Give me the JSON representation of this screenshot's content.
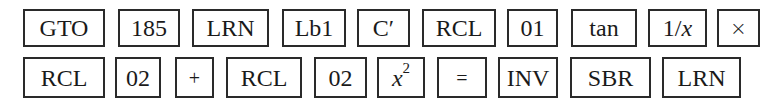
{
  "rows": [
    {
      "keys": [
        {
          "label": "GTO"
        },
        {
          "label": "185"
        },
        {
          "label": "LRN"
        },
        {
          "label": "Lb1"
        },
        {
          "label": "C′"
        },
        {
          "label": "RCL"
        },
        {
          "label": "01"
        },
        {
          "label": "tan"
        },
        {
          "label_prefix": "1/",
          "label_var": "x"
        },
        {
          "label": "×"
        }
      ]
    },
    {
      "keys": [
        {
          "label": "RCL"
        },
        {
          "label": "02"
        },
        {
          "label": "+"
        },
        {
          "label": "RCL"
        },
        {
          "label": "02"
        },
        {
          "label_var": "x",
          "label_sup": "2"
        },
        {
          "label": "="
        },
        {
          "label": "INV"
        },
        {
          "label": "SBR"
        },
        {
          "label": "LRN"
        }
      ]
    }
  ]
}
